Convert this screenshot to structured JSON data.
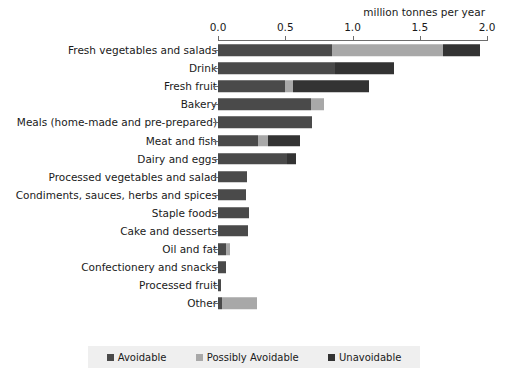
{
  "chart_data": {
    "type": "bar",
    "orientation": "horizontal",
    "stacked": true,
    "title": "",
    "xlabel": "million tonnes per year",
    "ylabel": "",
    "xlim": [
      0.0,
      2.0
    ],
    "xticks": [
      "0.0",
      "0.5",
      "1.0",
      "1.5",
      "2.0"
    ],
    "xtick_values": [
      0.0,
      0.5,
      1.0,
      1.5,
      2.0
    ],
    "grid": false,
    "legend_position": "bottom",
    "categories": [
      "Fresh vegetables and salads",
      "Drink",
      "Fresh fruit",
      "Bakery",
      "Meals (home-made and pre-prepared)",
      "Meat and fish",
      "Dairy and eggs",
      "Processed vegetables and salad",
      "Condiments, sauces, herbs and spices",
      "Staple foods",
      "Cake and desserts",
      "Oil and fat",
      "Confectionery and snacks",
      "Processed fruit",
      "Other"
    ],
    "series": [
      {
        "name": "Avoidable",
        "color": "#4a4a4a",
        "values": [
          0.85,
          0.87,
          0.5,
          0.69,
          0.7,
          0.3,
          0.51,
          0.215,
          0.21,
          0.23,
          0.22,
          0.06,
          0.06,
          0.025,
          0.03
        ]
      },
      {
        "name": "Possibly Avoidable",
        "color": "#a8a8a8",
        "values": [
          0.82,
          0.0,
          0.06,
          0.1,
          0.0,
          0.07,
          0.0,
          0.0,
          0.0,
          0.0,
          0.0,
          0.03,
          0.0,
          0.0,
          0.26
        ]
      },
      {
        "name": "Unavoidable",
        "color": "#333333",
        "values": [
          0.28,
          0.44,
          0.56,
          0.0,
          0.0,
          0.24,
          0.07,
          0.0,
          0.0,
          0.0,
          0.0,
          0.0,
          0.0,
          0.0,
          0.0
        ]
      }
    ]
  }
}
